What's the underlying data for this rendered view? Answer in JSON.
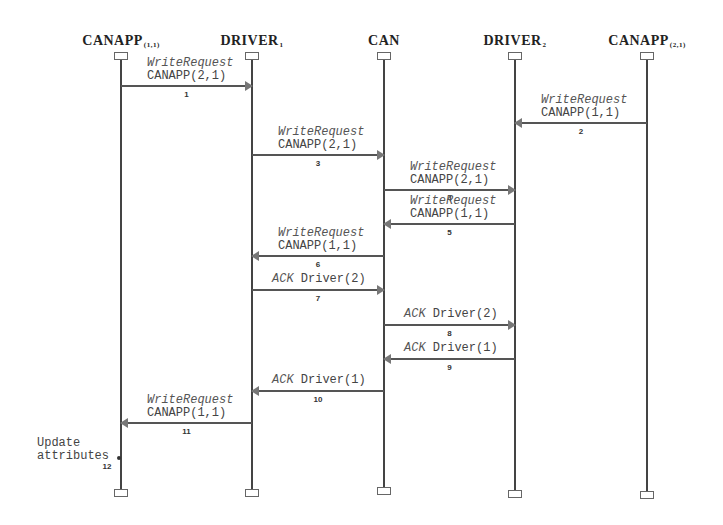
{
  "actors": [
    {
      "name": "CANAPP",
      "sub": "(1,1)",
      "x": 121
    },
    {
      "name": "DRIVER",
      "sub": "1",
      "x": 252
    },
    {
      "name": "CAN",
      "sub": "",
      "x": 384
    },
    {
      "name": "DRIVER",
      "sub": "2",
      "x": 515
    },
    {
      "name": "CANAPP",
      "sub": "(2,1)",
      "x": 647
    }
  ],
  "messages": [
    {
      "n": "1",
      "from": 0,
      "to": 1,
      "y": 86,
      "kind": "WriteRequest",
      "arg": "CANAPP(2,1)"
    },
    {
      "n": "2",
      "from": 4,
      "to": 3,
      "y": 123,
      "kind": "WriteRequest",
      "arg": "CANAPP(1,1)"
    },
    {
      "n": "3",
      "from": 1,
      "to": 2,
      "y": 155,
      "kind": "WriteRequest",
      "arg": "CANAPP(2,1)"
    },
    {
      "n": "4",
      "from": 2,
      "to": 3,
      "y": 190,
      "kind": "WriteRequest",
      "arg": "CANAPP(2,1)"
    },
    {
      "n": "5",
      "from": 3,
      "to": 2,
      "y": 224,
      "kind": "WriteRequest",
      "arg": "CANAPP(1,1)"
    },
    {
      "n": "6",
      "from": 2,
      "to": 1,
      "y": 256,
      "kind": "WriteRequest",
      "arg": "CANAPP(1,1)"
    },
    {
      "n": "7",
      "from": 1,
      "to": 2,
      "y": 290,
      "kind": "ACK",
      "arg": "Driver(2)"
    },
    {
      "n": "8",
      "from": 2,
      "to": 3,
      "y": 325,
      "kind": "ACK",
      "arg": "Driver(2)"
    },
    {
      "n": "9",
      "from": 3,
      "to": 2,
      "y": 359,
      "kind": "ACK",
      "arg": "Driver(1)"
    },
    {
      "n": "10",
      "from": 2,
      "to": 1,
      "y": 391,
      "kind": "ACK",
      "arg": "Driver(1)"
    },
    {
      "n": "11",
      "from": 1,
      "to": 0,
      "y": 423,
      "kind": "WriteRequest",
      "arg": "CANAPP(1,1)"
    }
  ],
  "note": {
    "text": "Update\nattributes",
    "n": "12"
  }
}
